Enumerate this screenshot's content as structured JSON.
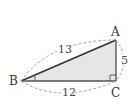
{
  "diagram": {
    "type": "right-triangle",
    "vertices": {
      "A": {
        "label": "A"
      },
      "B": {
        "label": "B"
      },
      "C": {
        "label": "C"
      }
    },
    "sides": {
      "AB": {
        "label": "13"
      },
      "BC": {
        "label": "12"
      },
      "AC": {
        "label": "5"
      }
    },
    "right_angle_at": "C",
    "marked_angle_at": "B",
    "colors": {
      "fill": "#e6e6e6",
      "stroke": "#333333",
      "dashed": "#999999"
    }
  }
}
